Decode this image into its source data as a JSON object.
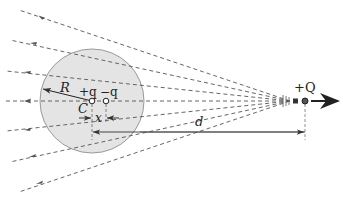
{
  "diagram": {
    "labels": {
      "R": "R",
      "C": "C",
      "plus_q": "+q",
      "minus_q": "−q",
      "x": "x",
      "d": "d",
      "plus_Q": "+Q"
    },
    "colors": {
      "sphere_fill": "#e4e4e4",
      "sphere_stroke": "#9a9a9a",
      "field_line": "#555555",
      "arrow": "#222222"
    },
    "sphere": {
      "cx": 92,
      "cy": 101,
      "r": 52
    },
    "charges": {
      "plus_q": {
        "x": 92,
        "y": 101
      },
      "minus_q": {
        "x": 106,
        "y": 101
      },
      "plus_Q": {
        "x": 305,
        "y": 101
      }
    },
    "field_lines": [
      {
        "x1": 19,
        "y1": 10
      },
      {
        "x1": 10,
        "y1": 40
      },
      {
        "x1": 6,
        "y1": 71
      },
      {
        "x1": 3,
        "y1": 101
      },
      {
        "x1": 6,
        "y1": 131
      },
      {
        "x1": 10,
        "y1": 162
      },
      {
        "x1": 19,
        "y1": 192
      }
    ],
    "field_line_convergence": {
      "x": 290,
      "y": 101
    },
    "velocity_arrow": {
      "x1": 311,
      "x2": 338,
      "y": 101
    },
    "dimension_d": {
      "x1": 92,
      "x2": 305,
      "y": 132
    },
    "dimension_x": {
      "x1": 92,
      "x2": 106,
      "y": 118
    }
  }
}
